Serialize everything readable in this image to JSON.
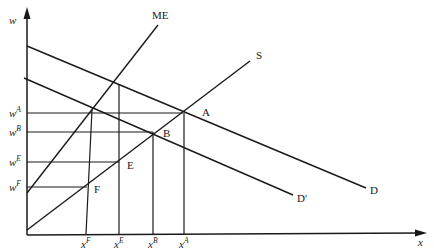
{
  "diagram": {
    "type": "economics-monopsony-wage-employment",
    "axes": {
      "y_label": "w",
      "x_label": "x"
    },
    "curves": {
      "marginal_expenditure": "ME",
      "supply": "S",
      "demand": "D",
      "demand_shifted": "D'"
    },
    "points": {
      "A": "A",
      "B": "B",
      "E": "E",
      "F": "F"
    },
    "y_ticks": [
      {
        "base": "w",
        "sup": "A"
      },
      {
        "base": "w",
        "sup": "B"
      },
      {
        "base": "w",
        "sup": "E"
      },
      {
        "base": "w",
        "sup": "F"
      }
    ],
    "x_ticks": [
      {
        "base": "x",
        "sup": "F"
      },
      {
        "base": "x",
        "sup": "E"
      },
      {
        "base": "x",
        "sup": "B"
      },
      {
        "base": "x",
        "sup": "A"
      }
    ]
  }
}
